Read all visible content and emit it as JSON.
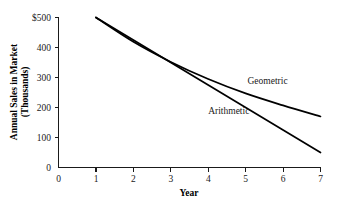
{
  "chart_data": {
    "type": "line",
    "title": "",
    "xlabel": "Year",
    "ylabel": "Annual Sales in Market (Thousands)",
    "ylabel_line1": "Annual Sales in Market",
    "ylabel_line2": "(Thousands)",
    "xlim": [
      0,
      7
    ],
    "ylim": [
      0,
      500
    ],
    "grid": false,
    "legend_position": "inline-annotations",
    "x_ticks": [
      0,
      1,
      2,
      3,
      4,
      5,
      6,
      7
    ],
    "x_tick_labels": [
      "0",
      "1",
      "2",
      "3",
      "4",
      "5",
      "6",
      "7"
    ],
    "y_ticks": [
      0,
      100,
      200,
      300,
      400,
      500
    ],
    "y_tick_labels": [
      "0",
      "100",
      "200",
      "300",
      "400",
      "$500"
    ],
    "x": [
      1,
      2,
      3,
      4,
      5,
      6,
      7
    ],
    "series": [
      {
        "name": "Geometric",
        "values": [
          500,
          419,
          352,
          295,
          247,
          207,
          170
        ],
        "annotation": "Geometric"
      },
      {
        "name": "Arithmetic",
        "values": [
          500,
          425,
          350,
          275,
          200,
          125,
          50
        ],
        "annotation": "Arithmetic"
      }
    ],
    "annotations": [
      {
        "text": "Geometric",
        "x": 5.05,
        "y": 278
      },
      {
        "text": "Arithmetic",
        "x": 4.0,
        "y": 178
      }
    ],
    "colors": {
      "line": "#000000",
      "axis": "#1a1a1a",
      "background": "#ffffff"
    }
  }
}
